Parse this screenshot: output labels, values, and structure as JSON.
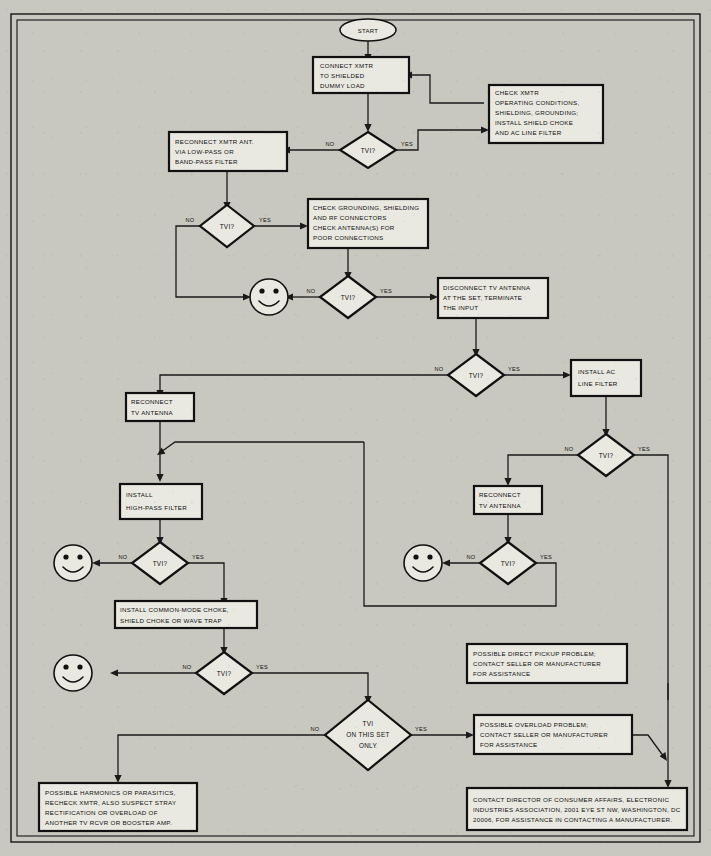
{
  "document": {
    "title": "TVI Troubleshooting Flowchart",
    "background_color": "#c9c8c0",
    "ink_color": "#111111"
  },
  "labels": {
    "yes": "YES",
    "no": "NO",
    "start": "START",
    "tvi_question": "TVI?"
  },
  "nodes": {
    "start": {
      "text": "START",
      "shape": "oval"
    },
    "connect_dummy_load": {
      "lines": [
        "CONNECT XMTR",
        "TO SHIELDED",
        "DUMMY LOAD"
      ],
      "shape": "process"
    },
    "check_xmtr": {
      "lines": [
        "CHECK XMTR",
        "OPERATING CONDITIONS,",
        "SHIELDING, GROUNDING;",
        "INSTALL SHIELD CHOKE",
        "AND AC LINE FILTER"
      ],
      "shape": "process"
    },
    "reconnect_xmtr_ant": {
      "lines": [
        "RECONNECT XMTR ANT.",
        "VIA LOW-PASS OR",
        "BAND-PASS FILTER"
      ],
      "shape": "process"
    },
    "check_grounding": {
      "lines": [
        "CHECK GROUNDING, SHIELDING",
        "AND RF CONNECTORS",
        "CHECK ANTENNA(S) FOR",
        "POOR CONNECTIONS"
      ],
      "shape": "process"
    },
    "disconnect_tv_antenna": {
      "lines": [
        "DISCONNECT TV ANTENNA",
        "AT THE SET, TERMINATE",
        "THE INPUT"
      ],
      "shape": "process"
    },
    "install_ac_line_filter": {
      "lines": [
        "INSTALL AC",
        "LINE FILTER"
      ],
      "shape": "process"
    },
    "reconnect_tv_antenna_left": {
      "lines": [
        "RECONNECT",
        "TV ANTENNA"
      ],
      "shape": "process"
    },
    "reconnect_tv_antenna_right": {
      "lines": [
        "RECONNECT",
        "TV ANTENNA"
      ],
      "shape": "process"
    },
    "install_high_pass_filter": {
      "lines": [
        "INSTALL",
        "HIGH-PASS FILTER"
      ],
      "shape": "process"
    },
    "install_common_mode_choke": {
      "lines": [
        "INSTALL COMMON-MODE CHOKE,",
        "SHIELD CHOKE OR WAVE TRAP"
      ],
      "shape": "process"
    },
    "possible_direct_pickup": {
      "lines": [
        "POSSIBLE DIRECT PICKUP PROBLEM;",
        "CONTACT SELLER OR MANUFACTURER",
        "FOR ASSISTANCE"
      ],
      "shape": "process"
    },
    "possible_overload": {
      "lines": [
        "POSSIBLE OVERLOAD PROBLEM;",
        "CONTACT SELLER OR MANUFACTURER",
        "FOR ASSISTANCE"
      ],
      "shape": "process"
    },
    "possible_harmonics": {
      "lines": [
        "POSSIBLE HARMONICS OR PARASITICS,",
        "RECHECK XMTR, ALSO SUSPECT STRAY",
        "RECTIFICATION OR OVERLOAD OF",
        "ANOTHER TV RCVR OR BOOSTER AMP."
      ],
      "shape": "process"
    },
    "contact_director": {
      "lines": [
        "CONTACT DIRECTOR OF CONSUMER AFFAIRS, ELECTRONIC",
        "INDUSTRIES ASSOCIATION, 2001 EYE ST NW, WASHINGTON, DC",
        "20006, FOR ASSISTANCE IN CONTACTING A MANUFACTURER."
      ],
      "shape": "process"
    },
    "decision_1": {
      "lines": [
        "TVI?"
      ],
      "shape": "decision"
    },
    "decision_2": {
      "lines": [
        "TVI?"
      ],
      "shape": "decision"
    },
    "decision_3": {
      "lines": [
        "TVI?"
      ],
      "shape": "decision"
    },
    "decision_4": {
      "lines": [
        "TVI?"
      ],
      "shape": "decision"
    },
    "decision_5": {
      "lines": [
        "TVI?"
      ],
      "shape": "decision"
    },
    "decision_6": {
      "lines": [
        "TVI?"
      ],
      "shape": "decision"
    },
    "decision_7": {
      "lines": [
        "TVI?"
      ],
      "shape": "decision"
    },
    "decision_8": {
      "lines": [
        "TVI?"
      ],
      "shape": "decision"
    },
    "decision_final": {
      "lines": [
        "TVI",
        "ON THIS SET",
        "ONLY"
      ],
      "shape": "decision"
    },
    "smiley_1": {
      "text": "",
      "shape": "smiley"
    },
    "smiley_2": {
      "text": "",
      "shape": "smiley"
    },
    "smiley_3": {
      "text": "",
      "shape": "smiley"
    },
    "smiley_4": {
      "text": "",
      "shape": "smiley"
    }
  },
  "edge_labels": [
    {
      "id": "e1-no",
      "text": "NO"
    },
    {
      "id": "e1-yes",
      "text": "YES"
    },
    {
      "id": "e2-no",
      "text": "NO"
    },
    {
      "id": "e2-yes",
      "text": "YES"
    },
    {
      "id": "e3-no",
      "text": "NO"
    },
    {
      "id": "e3-yes",
      "text": "YES"
    },
    {
      "id": "e4-no",
      "text": "NO"
    },
    {
      "id": "e4-yes",
      "text": "YES"
    },
    {
      "id": "e5-no",
      "text": "NO"
    },
    {
      "id": "e5-yes",
      "text": "YES"
    },
    {
      "id": "e6-no",
      "text": "NO"
    },
    {
      "id": "e6-yes",
      "text": "YES"
    },
    {
      "id": "e7-no",
      "text": "NO"
    },
    {
      "id": "e7-yes",
      "text": "YES"
    },
    {
      "id": "e8-no",
      "text": "NO"
    },
    {
      "id": "e8-yes",
      "text": "YES"
    },
    {
      "id": "efinal-no",
      "text": "NO"
    },
    {
      "id": "efinal-yes",
      "text": "YES"
    }
  ]
}
